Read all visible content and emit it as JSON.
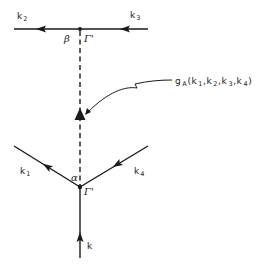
{
  "diagram": {
    "type": "feynman-vertex-diagram",
    "colors": {
      "line": "#1a1a1a",
      "background": "#ffffff"
    },
    "vertices": {
      "top": {
        "x": 80,
        "y": 29,
        "greek_label": "β",
        "gamma_label": "Γ'"
      },
      "bottom": {
        "x": 80,
        "y": 187,
        "greek_label": "α",
        "gamma_label": "Γ'"
      }
    },
    "lines": {
      "k2": {
        "label_main": "k",
        "label_sub": "2",
        "style": "solid",
        "direction": "outgoing-left"
      },
      "k3": {
        "label_main": "k",
        "label_sub": "3",
        "style": "solid",
        "direction": "incoming-from-right"
      },
      "k1": {
        "label_main": "k",
        "label_sub": "1",
        "style": "solid",
        "direction": "outgoing-upper-left"
      },
      "k4": {
        "label_main": "k",
        "label_sub": "4",
        "style": "solid",
        "direction": "incoming-from-upper-right"
      },
      "k": {
        "label_main": "k",
        "label_sub": "",
        "style": "solid",
        "direction": "incoming-from-below"
      },
      "propagator": {
        "style": "dashed",
        "marker": "filled-triangle"
      }
    },
    "annotation": {
      "symbol_main": "g",
      "symbol_sub": "A",
      "args_open": "(",
      "args": [
        {
          "main": "k",
          "sub": "1"
        },
        {
          "main": "k",
          "sub": "2"
        },
        {
          "main": "k",
          "sub": "3"
        },
        {
          "main": "k",
          "sub": "4"
        }
      ],
      "separator": ",",
      "args_close": ")",
      "pointer": "wavy-arrow-to-triangle"
    }
  }
}
